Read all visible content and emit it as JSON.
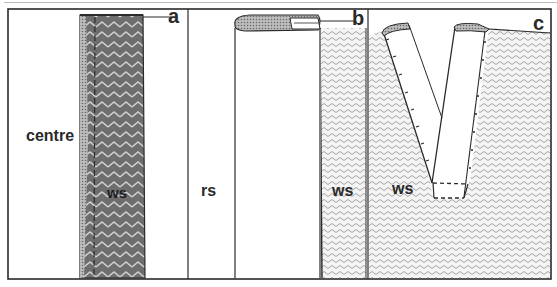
{
  "figure": {
    "panels": [
      {
        "id": "a",
        "letter": "a",
        "labels": {
          "centre": "centre",
          "ws": "ws"
        }
      },
      {
        "id": "b",
        "letter": "b",
        "labels": {
          "rs": "rs",
          "ws": "ws"
        }
      },
      {
        "id": "c",
        "letter": "c",
        "labels": {
          "ws": "ws"
        }
      }
    ]
  },
  "colors": {
    "line": "#2a2a2a",
    "dark_fabric": "#6a6a6a",
    "light_fabric": "#d8d8d8",
    "background": "#ffffff"
  }
}
